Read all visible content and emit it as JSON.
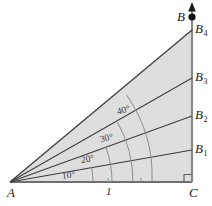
{
  "figure": {
    "colors": {
      "fill": "#dedede",
      "stroke": "#3c3c3c",
      "base_stroke": "#6e6e6e",
      "axis_stroke": "#7a7a7a",
      "label": "#1a1a1a",
      "angle_label": "#3a3a3a",
      "background": "#ffffff"
    },
    "vertices": {
      "A": {
        "label": "A",
        "x": 10,
        "y": 182
      },
      "C": {
        "label": "C",
        "x": 192,
        "y": 182
      },
      "B": {
        "label": "B",
        "x": 192,
        "y": 17
      }
    },
    "axis_arrow": {
      "name": "up-arrow",
      "tip_x": 192,
      "tip_y": 3
    },
    "right_angle_marker": {
      "at": "C",
      "size": 7
    },
    "base_tick": {
      "label": "1",
      "x": 108,
      "y": 182
    },
    "ray_endpoints": [
      {
        "label": "B",
        "sub": "1",
        "angle": 10,
        "x": 192,
        "y": 150
      },
      {
        "label": "B",
        "sub": "2",
        "angle": 20,
        "x": 192,
        "y": 116
      },
      {
        "label": "B",
        "sub": "3",
        "angle": 30,
        "x": 192,
        "y": 78
      },
      {
        "label": "B",
        "sub": "4",
        "angle": 40,
        "x": 192,
        "y": 30
      }
    ],
    "angle_labels": [
      {
        "text": "10°",
        "x": 62,
        "y": 171,
        "rotate": -6
      },
      {
        "text": "20°",
        "x": 81,
        "y": 156,
        "rotate": -10
      },
      {
        "text": "30°",
        "x": 100,
        "y": 135,
        "rotate": -13
      },
      {
        "text": "40°",
        "x": 117,
        "y": 107,
        "rotate": -17
      }
    ]
  }
}
